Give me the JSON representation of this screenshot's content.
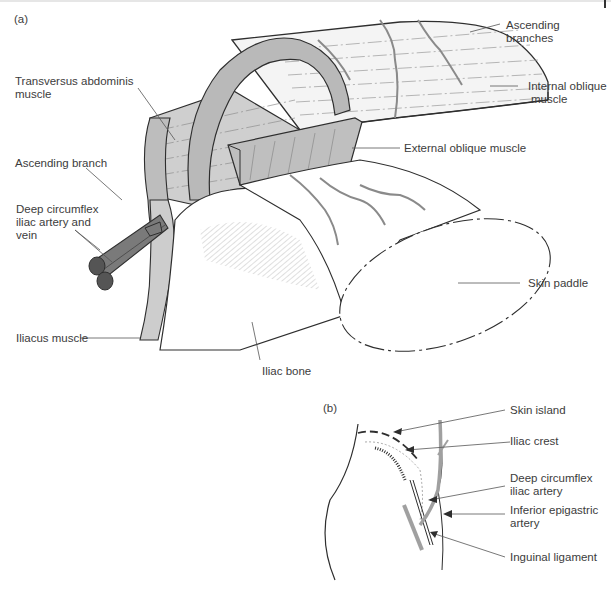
{
  "figure": {
    "panel_a": {
      "label": "(a)",
      "labels": {
        "transversus_abdominis_1": "Transversus abdominis",
        "transversus_abdominis_2": "muscle",
        "ascending_branch": "Ascending branch",
        "deep_circumflex_1": "Deep circumflex",
        "deep_circumflex_2": "iliac artery and",
        "deep_circumflex_3": "vein",
        "iliacus_muscle": "Iliacus muscle",
        "ascending_branches_1": "Ascending",
        "ascending_branches_2": "branches",
        "internal_oblique_1": "Internal oblique",
        "internal_oblique_2": "muscle",
        "external_oblique": "External oblique muscle",
        "skin_paddle": "Skin paddle",
        "iliac_bone": "Iliac bone"
      }
    },
    "panel_b": {
      "label": "(b)",
      "labels": {
        "skin_island": "Skin island",
        "iliac_crest": "Iliac crest",
        "deep_circumflex_1": "Deep circumflex",
        "deep_circumflex_2": "iliac artery",
        "inferior_epigastric_1": "Inferior epigastric",
        "inferior_epigastric_2": "artery",
        "inguinal_ligament": "Inguinal ligament"
      }
    },
    "colors": {
      "outline": "#2e2e2e",
      "muscle_fill": "#c9c9c9",
      "muscle_light": "#e4e4e4",
      "vessel_fill": "#7a7a7a",
      "vessel_light": "#a8a8a8",
      "leader_line": "#555555"
    }
  }
}
